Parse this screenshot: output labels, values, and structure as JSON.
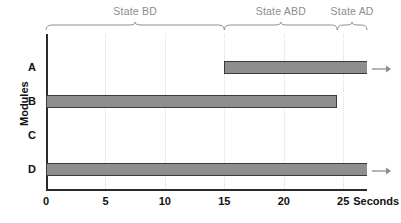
{
  "chart_data": {
    "type": "bar",
    "orientation": "horizontal",
    "title": "",
    "xlabel": "Seconds",
    "ylabel": "Modules",
    "xlim": [
      0,
      27
    ],
    "xticks": [
      0,
      5,
      10,
      15,
      20,
      25
    ],
    "xtick_labels": [
      "0",
      "5",
      "10",
      "15",
      "20",
      "25"
    ],
    "x_unit_label": "Seconds",
    "categories": [
      "A",
      "B",
      "C",
      "D"
    ],
    "grid": "vertical-dotted",
    "legend": "none",
    "bars": [
      {
        "category": "A",
        "start": 15.0,
        "end": 27.0,
        "continues": true
      },
      {
        "category": "B",
        "start": 0.0,
        "end": 24.5,
        "continues": false
      },
      {
        "category": "C",
        "start": 0.0,
        "end": 0.0,
        "continues": false
      },
      {
        "category": "D",
        "start": 0.0,
        "end": 27.0,
        "continues": true
      }
    ],
    "annotations": [
      {
        "label": "State BD",
        "start": 0.0,
        "end": 15.0
      },
      {
        "label": "State ABD",
        "start": 15.0,
        "end": 24.5
      },
      {
        "label": "State AD",
        "start": 24.5,
        "end": 27.0
      }
    ],
    "colors": {
      "bar_fill": "#8e8e8e",
      "bar_border": "#3a3a3a",
      "axis": "#2b2b2b",
      "grid": "#dcdcdc",
      "state_label": "#8d8d8d",
      "arrow": "#8d8d8d",
      "background": "#ffffff"
    }
  },
  "axis": {
    "y_title": "Modules",
    "x_unit": "Seconds",
    "ticks": [
      "0",
      "5",
      "10",
      "15",
      "20",
      "25"
    ],
    "row_labels": [
      "A",
      "B",
      "C",
      "D"
    ]
  },
  "states": {
    "state_1": "State BD",
    "state_2": "State ABD",
    "state_3": "State AD"
  }
}
